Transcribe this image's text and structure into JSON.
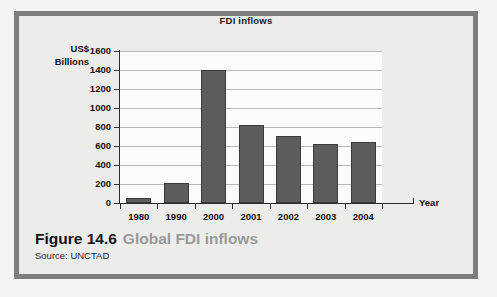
{
  "figure": {
    "caption_label": "Figure 14.6",
    "caption_title": "Global FDI inflows",
    "source": "Source: UNCTAD",
    "frame_color": "#7d7d7d",
    "panel_color": "#ececeb",
    "caption_title_color": "#9a9a9a"
  },
  "chart_data": {
    "type": "bar",
    "title": "FDI inflows",
    "xlabel": "Year",
    "ylabel": "US$ Billions",
    "ylabel_lines": [
      "US$",
      "Billions"
    ],
    "categories": [
      "1980",
      "1990",
      "2000",
      "2001",
      "2002",
      "2003",
      "2004"
    ],
    "values": [
      55,
      210,
      1395,
      825,
      710,
      620,
      640
    ],
    "yticks": [
      0,
      200,
      400,
      600,
      800,
      1000,
      1200,
      1400,
      1600
    ],
    "ylim": [
      0,
      1600
    ],
    "grid": true,
    "legend": null,
    "bar_color": "#5d5d5d",
    "plot_background": "#fbfbfb",
    "gridline_color": "#b9b9b9",
    "axis_color": "#2b2b2b"
  }
}
